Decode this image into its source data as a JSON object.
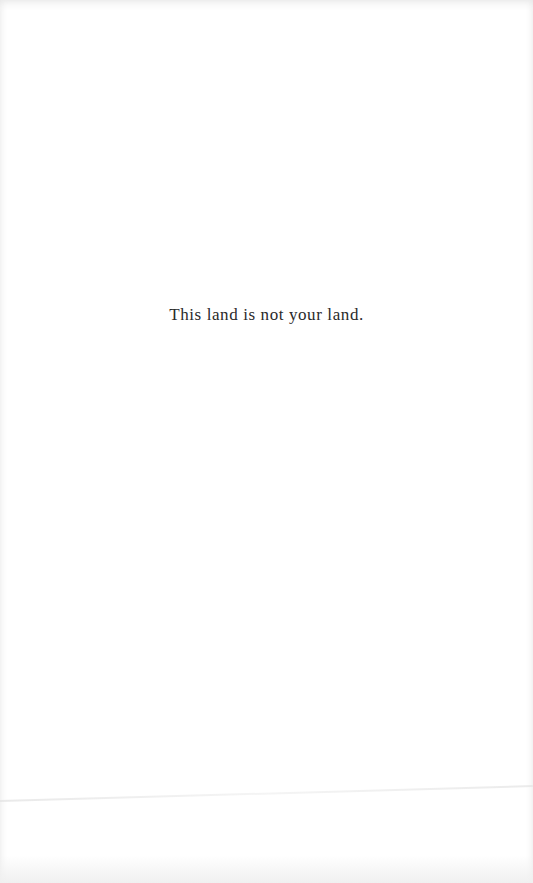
{
  "page": {
    "epigraph": "This land is not your land."
  }
}
